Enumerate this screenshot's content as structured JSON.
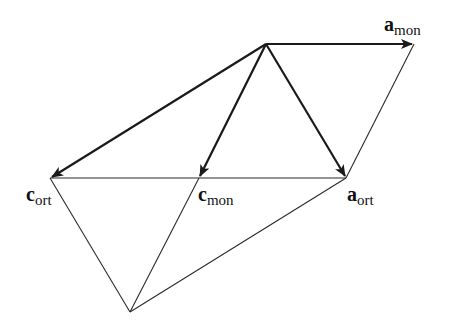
{
  "diagram": {
    "title": "",
    "type": "vector-lattice-relationship",
    "points": {
      "origin": {
        "x": 266,
        "y": 44
      },
      "a_mon": {
        "x": 414,
        "y": 44
      },
      "c_ort": {
        "x": 50,
        "y": 178
      },
      "c_mon": {
        "x": 199,
        "y": 178
      },
      "a_ort": {
        "x": 346,
        "y": 178
      },
      "bottom": {
        "x": 130,
        "y": 312
      }
    },
    "vectors": [
      {
        "from": "origin",
        "to": "a_mon",
        "label": "a_mon"
      },
      {
        "from": "origin",
        "to": "c_ort",
        "label": "c_ort"
      },
      {
        "from": "origin",
        "to": "c_mon",
        "label": "c_mon"
      },
      {
        "from": "origin",
        "to": "a_ort",
        "label": "a_ort"
      }
    ],
    "edges": [
      {
        "from": "c_ort",
        "to": "a_ort"
      },
      {
        "from": "a_mon",
        "to": "a_ort"
      },
      {
        "from": "c_ort",
        "to": "bottom"
      },
      {
        "from": "c_mon",
        "to": "bottom"
      },
      {
        "from": "a_ort",
        "to": "bottom"
      }
    ],
    "labels": {
      "a_mon": {
        "main": "a",
        "sub": "mon"
      },
      "c_ort": {
        "main": "c",
        "sub": "ort"
      },
      "c_mon": {
        "main": "c",
        "sub": "mon"
      },
      "a_ort": {
        "main": "a",
        "sub": "ort"
      }
    },
    "colors": {
      "line": "#1a1a1a",
      "background": "#ffffff"
    }
  }
}
